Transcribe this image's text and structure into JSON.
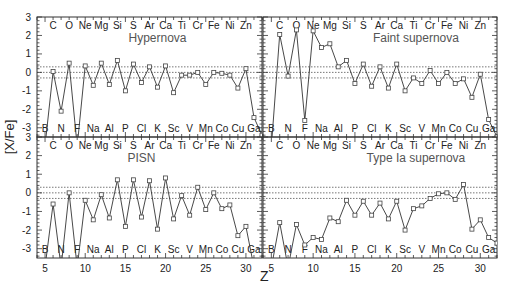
{
  "chart_data": {
    "type": "line",
    "title": "",
    "xlabel": "Z",
    "ylabel": "[X/Fe]",
    "xlim": [
      4,
      32
    ],
    "ylim": [
      -3.5,
      3
    ],
    "x_ticks": [
      5,
      10,
      15,
      20,
      25,
      30
    ],
    "y_ticks": [
      -3,
      -2,
      -1,
      0,
      1,
      2,
      3
    ],
    "reference_lines": [
      0.3,
      0,
      -0.3
    ],
    "elements_top": [
      {
        "z": 6,
        "label": "C"
      },
      {
        "z": 8,
        "label": "O"
      },
      {
        "z": 10,
        "label": "Ne"
      },
      {
        "z": 12,
        "label": "Mg"
      },
      {
        "z": 14,
        "label": "Si"
      },
      {
        "z": 16,
        "label": "S"
      },
      {
        "z": 18,
        "label": "Ar"
      },
      {
        "z": 20,
        "label": "Ca"
      },
      {
        "z": 22,
        "label": "Ti"
      },
      {
        "z": 24,
        "label": "Cr"
      },
      {
        "z": 26,
        "label": "Fe"
      },
      {
        "z": 28,
        "label": "Ni"
      },
      {
        "z": 30,
        "label": "Zn"
      }
    ],
    "elements_bottom": [
      {
        "z": 5,
        "label": "B"
      },
      {
        "z": 7,
        "label": "N"
      },
      {
        "z": 9,
        "label": "F"
      },
      {
        "z": 11,
        "label": "Na"
      },
      {
        "z": 13,
        "label": "Al"
      },
      {
        "z": 15,
        "label": "P"
      },
      {
        "z": 17,
        "label": "Cl"
      },
      {
        "z": 19,
        "label": "K"
      },
      {
        "z": 21,
        "label": "Sc"
      },
      {
        "z": 23,
        "label": "V"
      },
      {
        "z": 25,
        "label": "Mn"
      },
      {
        "z": 27,
        "label": "Co"
      },
      {
        "z": 29,
        "label": "Cu"
      },
      {
        "z": 31,
        "label": "Ga"
      }
    ],
    "x": [
      5,
      6,
      7,
      8,
      9,
      10,
      11,
      12,
      13,
      14,
      15,
      16,
      17,
      18,
      19,
      20,
      21,
      22,
      23,
      24,
      25,
      26,
      27,
      28,
      29,
      30,
      31,
      32
    ],
    "series": [
      {
        "name": "Hypernova",
        "values": [
          -4.0,
          0.05,
          -2.1,
          0.5,
          -4.0,
          0.35,
          -0.7,
          0.5,
          -0.65,
          0.65,
          -1.0,
          0.45,
          -0.55,
          0.3,
          -0.8,
          0.35,
          -1.1,
          -0.15,
          -0.15,
          0.0,
          -0.65,
          0.0,
          -0.05,
          -0.15,
          -0.85,
          0.2,
          -2.45,
          -3.4
        ]
      },
      {
        "name": "Faint supernova",
        "values": [
          -4.0,
          2.05,
          -0.2,
          2.3,
          -2.6,
          2.25,
          1.35,
          1.55,
          0.3,
          0.65,
          -0.6,
          0.45,
          -0.75,
          0.3,
          -0.85,
          0.45,
          -1.0,
          -0.3,
          -0.6,
          0.1,
          -0.6,
          0.0,
          -0.6,
          -0.35,
          -1.35,
          -0.1,
          -2.55,
          -3.5
        ]
      },
      {
        "name": "PISN",
        "values": [
          -4.0,
          -0.6,
          -4.0,
          0.0,
          -4.0,
          -0.4,
          -1.45,
          -0.1,
          -1.35,
          0.7,
          -1.8,
          0.7,
          -1.3,
          0.65,
          -1.95,
          0.8,
          -1.4,
          -0.15,
          -1.2,
          0.3,
          -0.9,
          0.0,
          -0.85,
          -0.65,
          -2.3,
          -1.8,
          -4.0,
          -4.0
        ]
      },
      {
        "name": "Type Ia supernova",
        "values": [
          -4.0,
          -1.6,
          -4.0,
          -1.7,
          -2.8,
          -2.4,
          -2.5,
          -1.35,
          -1.55,
          -0.4,
          -1.2,
          -0.45,
          -1.2,
          -0.55,
          -1.4,
          -0.45,
          -2.0,
          -0.85,
          -0.7,
          -0.3,
          -0.05,
          0.0,
          -0.35,
          0.45,
          -1.95,
          -1.45,
          -2.4,
          -2.7
        ]
      }
    ],
    "panel_layout": "2x2 grid, shared axes",
    "legend": "panel titles inside each subplot"
  },
  "panels": [
    {
      "title": "Hypernova"
    },
    {
      "title": "Faint supernova"
    },
    {
      "title": "PISN"
    },
    {
      "title": "Type Ia supernova"
    }
  ],
  "axes": {
    "xlabel": "Z",
    "ylabel": "[X/Fe]",
    "x_tick_labels": [
      "5",
      "10",
      "15",
      "20",
      "25",
      "30"
    ],
    "y_tick_labels": [
      "3",
      "2",
      "1",
      "0",
      "-1",
      "-2",
      "-3"
    ]
  }
}
